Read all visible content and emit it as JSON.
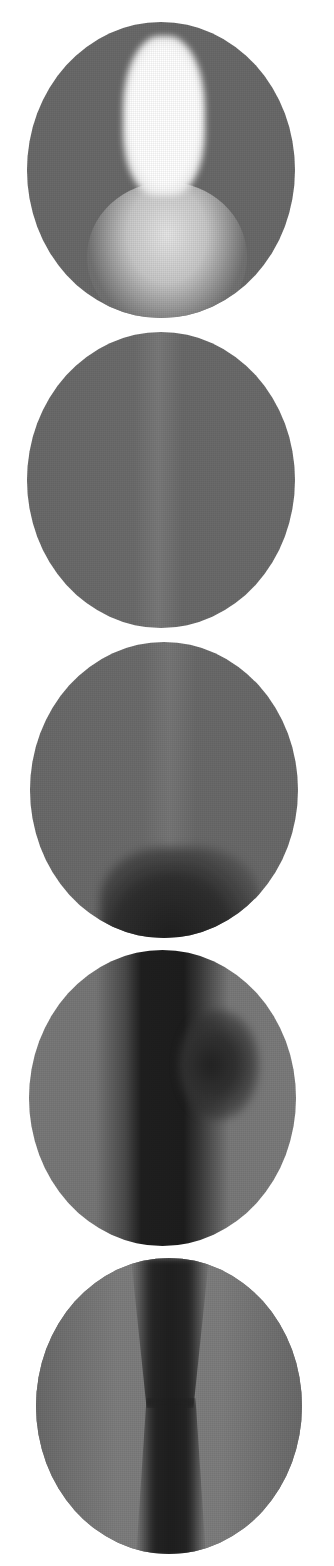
{
  "figure": {
    "panel_count": 5,
    "background": "#ffffff",
    "panels": [
      {
        "id": 1,
        "description": "bright elongated plume top-center over wider glowing base",
        "base_color": "#6a6a6a",
        "feature_color": "#ffffff"
      },
      {
        "id": 2,
        "description": "uniform gray field with faint vertical light streak",
        "base_color": "#6e6e6e",
        "feature_color": "#7c7c7c"
      },
      {
        "id": 3,
        "description": "gray field with dark region emerging at bottom center",
        "base_color": "#6c6c6c",
        "feature_color": "#2a2a2a"
      },
      {
        "id": 4,
        "description": "dark vertical column across full height with side lobe",
        "base_color": "#797979",
        "feature_color": "#1e1e1e"
      },
      {
        "id": 5,
        "description": "narrowing dark vertical jet, hourglass shape",
        "base_color": "#7c7c7c",
        "feature_color": "#202020"
      }
    ]
  }
}
